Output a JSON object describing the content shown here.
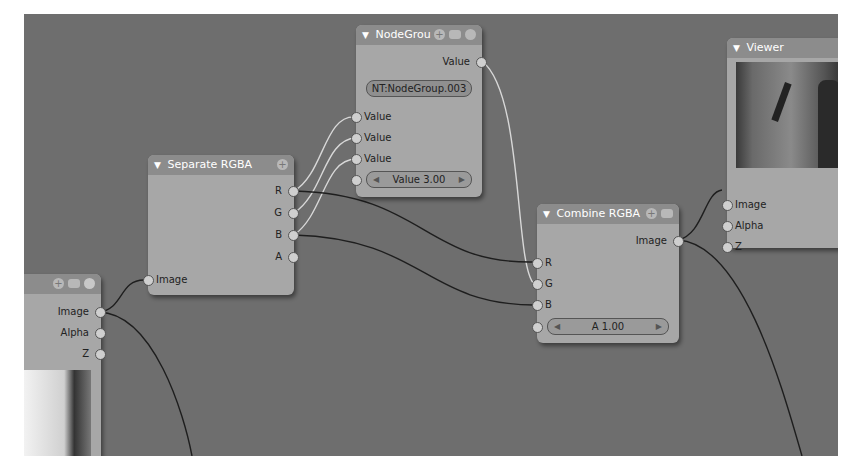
{
  "nodes": {
    "nodegroup": {
      "title": "NodeGrou",
      "output": "Value",
      "group_name": "NT:NodeGroup.003",
      "inputs": [
        "Value",
        "Value",
        "Value"
      ],
      "value_field": "Value 3.00"
    },
    "separate": {
      "title": "Separate RGBA",
      "outputs": [
        "R",
        "G",
        "B",
        "A"
      ],
      "input": "Image"
    },
    "combine": {
      "title": "Combine RGBA",
      "output": "Image",
      "inputs": [
        "R",
        "G",
        "B"
      ],
      "alpha_field": "A 1.00"
    },
    "viewer": {
      "title": "Viewer",
      "inputs": [
        "Image",
        "Alpha",
        "Z"
      ]
    },
    "render_layers": {
      "outputs": [
        "Image",
        "Alpha",
        "Z"
      ]
    }
  },
  "colors": {
    "canvas": "#6e6e6e",
    "node_body": "#a7a7a7",
    "node_header": "#8c8c8c"
  }
}
